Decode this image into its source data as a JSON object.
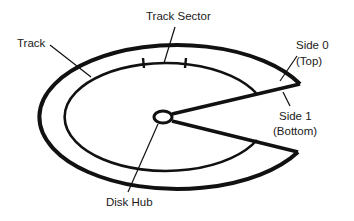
{
  "diagram": {
    "labels": {
      "track": "Track",
      "track_sector": "Track Sector",
      "side0_line1": "Side 0",
      "side0_line2": "(Top)",
      "side1_line1": "Side 1",
      "side1_line2": "(Bottom)",
      "disk_hub": "Disk Hub"
    },
    "colors": {
      "stroke": "#111111",
      "background": "#ffffff"
    }
  }
}
